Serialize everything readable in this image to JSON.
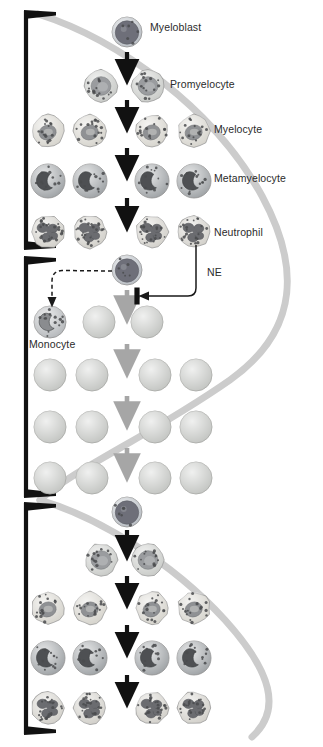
{
  "figure": {
    "background_color": "#ffffff",
    "curve_color": "#cccccc",
    "bracket_color": "#111111",
    "arrow_color_dark": "#111111",
    "arrow_color_gray": "#a6a6a6",
    "inhibitor_bar_color": "#111111"
  },
  "labels": {
    "myeloblast": "Myeloblast",
    "promyelocyte": "Promyelocyte",
    "myelocyte": "Myelocyte",
    "metamyelocyte": "Metamyelocyte",
    "neutrophil": "Neutrophil",
    "ne": "NE",
    "monocyte": "Monocyte"
  },
  "label_positions": {
    "myeloblast": {
      "x": 150,
      "y": 22
    },
    "promyelocyte": {
      "x": 170,
      "y": 79
    },
    "myelocyte": {
      "x": 214,
      "y": 124
    },
    "metamyelocyte": {
      "x": 214,
      "y": 173
    },
    "neutrophil": {
      "x": 214,
      "y": 227
    },
    "ne": {
      "x": 207,
      "y": 267
    },
    "monocyte": {
      "x": 29,
      "y": 339
    }
  },
  "panels": [
    {
      "id": "panel-normal-top",
      "name": "normal-maturation-top",
      "bracket": {
        "x": 22,
        "y_top": 10,
        "y_bottom": 250
      },
      "rows": [
        {
          "stage": "myeloblast",
          "y": 32,
          "cells": [
            {
              "x": 127,
              "type": "myeloblast"
            }
          ]
        },
        {
          "stage": "promyelocyte",
          "y": 86,
          "cells": [
            {
              "x": 101,
              "type": "promyelocyte"
            },
            {
              "x": 148,
              "type": "promyelocyte"
            }
          ]
        },
        {
          "stage": "myelocyte",
          "y": 131,
          "cells": [
            {
              "x": 48,
              "type": "myelocyte"
            },
            {
              "x": 90,
              "type": "myelocyte"
            },
            {
              "x": 152,
              "type": "myelocyte"
            },
            {
              "x": 194,
              "type": "myelocyte"
            }
          ]
        },
        {
          "stage": "metamyelocyte",
          "y": 181,
          "cells": [
            {
              "x": 48,
              "type": "metamyelocyte"
            },
            {
              "x": 90,
              "type": "metamyelocyte"
            },
            {
              "x": 152,
              "type": "metamyelocyte"
            },
            {
              "x": 194,
              "type": "metamyelocyte"
            }
          ]
        },
        {
          "stage": "neutrophil",
          "y": 232,
          "cells": [
            {
              "x": 48,
              "type": "neutrophil"
            },
            {
              "x": 90,
              "type": "neutrophil"
            },
            {
              "x": 152,
              "type": "neutrophil"
            },
            {
              "x": 194,
              "type": "neutrophil"
            }
          ]
        }
      ],
      "arrows": [
        {
          "x": 127,
          "y1": 52,
          "y2": 72,
          "color": "dark"
        },
        {
          "x": 127,
          "y1": 100,
          "y2": 120,
          "color": "dark"
        },
        {
          "x": 127,
          "y1": 148,
          "y2": 168,
          "color": "dark"
        },
        {
          "x": 127,
          "y1": 198,
          "y2": 219,
          "color": "dark"
        }
      ]
    },
    {
      "id": "panel-arrested",
      "name": "maturation-arrest-middle",
      "bracket": {
        "x": 22,
        "y_top": 256,
        "y_bottom": 498
      },
      "rows": [
        {
          "stage": "myeloblast",
          "y": 270,
          "cells": [
            {
              "x": 127,
              "type": "myeloblast"
            }
          ]
        },
        {
          "stage": "monocyte",
          "y": 322,
          "cells": [
            {
              "x": 50,
              "type": "monocyte"
            },
            {
              "x": 99,
              "type": "arrested"
            },
            {
              "x": 147,
              "type": "arrested"
            }
          ]
        },
        {
          "stage": "arrested",
          "y": 375,
          "cells": [
            {
              "x": 50,
              "type": "arrested"
            },
            {
              "x": 92,
              "type": "arrested"
            },
            {
              "x": 155,
              "type": "arrested"
            },
            {
              "x": 196,
              "type": "arrested"
            }
          ]
        },
        {
          "stage": "arrested",
          "y": 427,
          "cells": [
            {
              "x": 50,
              "type": "arrested"
            },
            {
              "x": 92,
              "type": "arrested"
            },
            {
              "x": 155,
              "type": "arrested"
            },
            {
              "x": 196,
              "type": "arrested"
            }
          ]
        },
        {
          "stage": "arrested",
          "y": 478,
          "cells": [
            {
              "x": 50,
              "type": "arrested"
            },
            {
              "x": 92,
              "type": "arrested"
            },
            {
              "x": 155,
              "type": "arrested"
            },
            {
              "x": 196,
              "type": "arrested"
            }
          ]
        }
      ],
      "arrows": [
        {
          "x": 127,
          "y1": 290,
          "y2": 310,
          "color": "gray"
        },
        {
          "x": 127,
          "y1": 344,
          "y2": 364,
          "color": "gray"
        },
        {
          "x": 127,
          "y1": 396,
          "y2": 416,
          "color": "gray"
        },
        {
          "x": 127,
          "y1": 448,
          "y2": 468,
          "color": "gray"
        }
      ],
      "dashed_arrow": {
        "from_x": 112,
        "from_y": 271,
        "to_x": 52,
        "to_y": 303,
        "style": "dashed",
        "label": "monocyte-shunt"
      },
      "ne_feedback": {
        "source_x": 196,
        "source_y": 245,
        "corner_x": 196,
        "corner_y": 296,
        "target_x": 143,
        "target_y": 296,
        "bar_x": 137,
        "bar_y": 296,
        "bar_height": 17,
        "label": "NE"
      }
    },
    {
      "id": "panel-normal-bottom",
      "name": "normal-maturation-bottom",
      "bracket": {
        "x": 22,
        "y_top": 502,
        "y_bottom": 735
      },
      "rows": [
        {
          "stage": "myeloblast",
          "y": 512,
          "cells": [
            {
              "x": 127,
              "type": "myeloblast"
            }
          ]
        },
        {
          "stage": "promyelocyte",
          "y": 560,
          "cells": [
            {
              "x": 101,
              "type": "promyelocyte"
            },
            {
              "x": 148,
              "type": "promyelocyte"
            }
          ]
        },
        {
          "stage": "myelocyte",
          "y": 608,
          "cells": [
            {
              "x": 48,
              "type": "myelocyte"
            },
            {
              "x": 90,
              "type": "myelocyte"
            },
            {
              "x": 152,
              "type": "myelocyte"
            },
            {
              "x": 194,
              "type": "myelocyte"
            }
          ]
        },
        {
          "stage": "metamyelocyte",
          "y": 658,
          "cells": [
            {
              "x": 48,
              "type": "metamyelocyte"
            },
            {
              "x": 90,
              "type": "metamyelocyte"
            },
            {
              "x": 152,
              "type": "metamyelocyte"
            },
            {
              "x": 194,
              "type": "metamyelocyte"
            }
          ]
        },
        {
          "stage": "neutrophil",
          "y": 708,
          "cells": [
            {
              "x": 48,
              "type": "neutrophil"
            },
            {
              "x": 90,
              "type": "neutrophil"
            },
            {
              "x": 152,
              "type": "neutrophil"
            },
            {
              "x": 194,
              "type": "neutrophil"
            }
          ]
        }
      ],
      "arrows": [
        {
          "x": 127,
          "y1": 530,
          "y2": 548,
          "color": "dark"
        },
        {
          "x": 127,
          "y1": 576,
          "y2": 596,
          "color": "dark"
        },
        {
          "x": 127,
          "y1": 625,
          "y2": 645,
          "color": "dark"
        },
        {
          "x": 127,
          "y1": 675,
          "y2": 695,
          "color": "dark"
        }
      ]
    }
  ],
  "cell_styles": {
    "myeloblast": {
      "radius": 15,
      "cytoplasm": "#b9bec4",
      "nucleus": "#6e6f79",
      "nucleus_kind": "large-round",
      "granules": 6
    },
    "promyelocyte": {
      "radius": 16,
      "cytoplasm": "#c9cbc8",
      "nucleus": "#9a9c9f",
      "nucleus_kind": "round-granular",
      "granules": 14
    },
    "myelocyte": {
      "radius": 16,
      "cytoplasm": "#d6d4cd",
      "nucleus": "#8f9194",
      "nucleus_kind": "oval",
      "granules": 16
    },
    "metamyelocyte": {
      "radius": 17,
      "cytoplasm": "#9fa3a6",
      "nucleus": "#4e5053",
      "nucleus_kind": "kidney",
      "granules": 12
    },
    "neutrophil": {
      "radius": 16,
      "cytoplasm": "#d2d0ca",
      "nucleus": "#6b6c70",
      "nucleus_kind": "lobed",
      "granules": 22
    },
    "monocyte": {
      "radius": 16,
      "cytoplasm": "#b5b8bb",
      "nucleus": "#8a8c8f",
      "nucleus_kind": "kidney",
      "granules": 14
    },
    "arrested": {
      "radius": 16,
      "cytoplasm": "#c3c5c2",
      "nucleus": "none",
      "nucleus_kind": "none",
      "granules": 0
    }
  },
  "gray_curve": {
    "description": "S-shaped light gray band sweeping behind the cells",
    "color": "#cbcbcb",
    "width": 7
  }
}
